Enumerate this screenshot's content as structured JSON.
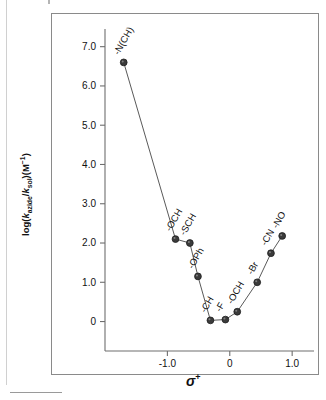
{
  "figure": {
    "y_axis_label": "log(kazide/ksol)(M-1)",
    "x_axis_label": "σ",
    "x_axis_label_sup": "+"
  },
  "chart_data": {
    "type": "scatter",
    "title": "",
    "xlabel": "σ+",
    "ylabel": "log(k_azide/k_sol)(M^-1)",
    "xlim": [
      -2.0,
      1.35
    ],
    "ylim": [
      -0.75,
      7.45
    ],
    "xticks": [
      -1.0,
      0,
      1.0
    ],
    "xticklabels": [
      "-1.0",
      "0",
      "1.0"
    ],
    "yticks": [
      0,
      1.0,
      2.0,
      3.0,
      4.0,
      5.0,
      6.0,
      7.0
    ],
    "yticklabels": [
      "0",
      "1.0",
      "2.0",
      "3.0",
      "4.0",
      "5.0",
      "6.0",
      "7.0"
    ],
    "grid": false,
    "legend": false,
    "marker_color": "#3b3b3b",
    "line_color": "#5a5a5a",
    "points": [
      {
        "label": "p-N(CH3)2",
        "label_html": "<i>p</i>-N(CH<sub>3</sub>)<sub>2</sub>",
        "x": -1.7,
        "y": 6.6
      },
      {
        "label": "p-OCH3",
        "label_html": "<i>p</i>-OCH<sub>3</sub>",
        "x": -0.87,
        "y": 2.1
      },
      {
        "label": "p-SCH3",
        "label_html": "<i>p</i>-SCH<sub>3</sub>",
        "x": -0.64,
        "y": 2.0
      },
      {
        "label": "p-OPh",
        "label_html": "<i>p</i>-OPh",
        "x": -0.51,
        "y": 1.15
      },
      {
        "label": "p-CH3",
        "label_html": "<i>p</i>-CH<sub>3</sub>",
        "x": -0.31,
        "y": 0.03
      },
      {
        "label": "p-F",
        "label_html": "<i>p</i>-F",
        "x": -0.07,
        "y": 0.05
      },
      {
        "label": "m-OCH3",
        "label_html": "<i>m</i>-OCH<sub>3</sub>",
        "x": 0.12,
        "y": 0.25
      },
      {
        "label": "m-Br",
        "label_html": "<i>m</i>-Br",
        "x": 0.44,
        "y": 1.0
      },
      {
        "label": "p-CN",
        "label_html": "<i>p</i>-CN",
        "x": 0.66,
        "y": 1.74
      },
      {
        "label": "p-NO2",
        "label_html": "<i>p</i>-NO<sub>2</sub>",
        "x": 0.84,
        "y": 2.18
      }
    ],
    "connecting_segments": [
      [
        0,
        1
      ],
      [
        1,
        2
      ],
      [
        2,
        3
      ],
      [
        3,
        4
      ],
      [
        4,
        5
      ],
      [
        5,
        6
      ],
      [
        6,
        7
      ],
      [
        7,
        8
      ],
      [
        8,
        9
      ]
    ]
  }
}
